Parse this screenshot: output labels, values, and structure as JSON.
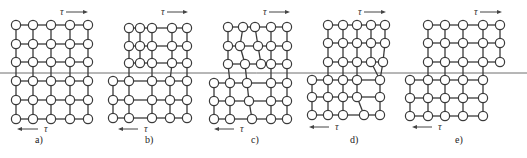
{
  "figure": {
    "caption_visible_fragment": "",
    "shear_symbol": "τ",
    "slip_plane_y": 73,
    "colors": {
      "line": "#3a3a3a",
      "atom_fill": "#ffffff",
      "slip_plane": "#6e6e6e",
      "background": "#ffffff"
    }
  },
  "panels": [
    {
      "label": "a)",
      "label_pos": [
        35,
        143
      ],
      "tau_top": {
        "text": "τ",
        "x": 60,
        "y": 15,
        "arrow": [
          66,
          12,
          88,
          12
        ],
        "dir": "right"
      },
      "tau_bottom": {
        "text": "τ",
        "x": 44,
        "y": 132,
        "arrow": [
          38,
          129,
          17,
          129
        ],
        "dir": "left"
      },
      "rows": [
        {
          "y": 25,
          "x": [
            16,
            33,
            51,
            70,
            88
          ]
        },
        {
          "y": 44,
          "x": [
            16,
            33,
            51,
            70,
            88
          ]
        },
        {
          "y": 62,
          "x": [
            16,
            33,
            51,
            70,
            88
          ]
        },
        {
          "y": 81,
          "x": [
            16,
            33,
            51,
            70,
            88
          ]
        },
        {
          "y": 100,
          "x": [
            16,
            33,
            51,
            70,
            88
          ]
        },
        {
          "y": 119,
          "x": [
            16,
            33,
            51,
            70,
            88
          ]
        }
      ]
    },
    {
      "label": "b)",
      "label_pos": [
        145,
        143
      ],
      "tau_top": {
        "text": "τ",
        "x": 161,
        "y": 15,
        "arrow": [
          167,
          12,
          188,
          12
        ],
        "dir": "right"
      },
      "tau_bottom": {
        "text": "τ",
        "x": 144,
        "y": 132,
        "arrow": [
          138,
          129,
          118,
          129
        ],
        "dir": "left"
      },
      "rows": [
        {
          "y": 28,
          "x": [
            129,
            140,
            152,
            172,
            187
          ]
        },
        {
          "y": 46,
          "x": [
            129,
            140,
            152,
            172,
            187
          ]
        },
        {
          "y": 63,
          "x": [
            129,
            140,
            152,
            172,
            187
          ]
        },
        {
          "y": 81,
          "x": [
            113,
            129,
            152,
            170,
            187
          ]
        },
        {
          "y": 100,
          "x": [
            113,
            129,
            152,
            170,
            187
          ]
        },
        {
          "y": 118,
          "x": [
            113,
            129,
            152,
            170,
            187
          ]
        }
      ]
    },
    {
      "label": "c)",
      "label_pos": [
        251,
        143
      ],
      "tau_top": {
        "text": "τ",
        "x": 263,
        "y": 15,
        "arrow": [
          269,
          12,
          290,
          12
        ],
        "dir": "right"
      },
      "tau_bottom": {
        "text": "τ",
        "x": 240,
        "y": 132,
        "arrow": [
          234,
          129,
          214,
          129
        ],
        "dir": "left"
      },
      "rows": [
        {
          "y": 27,
          "x": [
            228,
            243,
            255,
            271,
            287
          ]
        },
        {
          "y": 46,
          "x": [
            228,
            240,
            258,
            271,
            287
          ]
        },
        {
          "y": 64,
          "x": [
            228,
            245,
            261,
            271,
            287
          ]
        },
        {
          "y": 83,
          "x": [
            214,
            230,
            247,
            271,
            287
          ]
        },
        {
          "y": 101,
          "x": [
            214,
            230,
            249,
            271,
            287
          ]
        },
        {
          "y": 119,
          "x": [
            214,
            230,
            252,
            271,
            287
          ]
        }
      ]
    },
    {
      "label": "d)",
      "label_pos": [
        350,
        143
      ],
      "tau_top": {
        "text": "τ",
        "x": 358,
        "y": 15,
        "arrow": [
          364,
          12,
          386,
          12
        ],
        "dir": "right"
      },
      "tau_bottom": {
        "text": "τ",
        "x": 335,
        "y": 130,
        "arrow": [
          329,
          127,
          309,
          127
        ],
        "dir": "left"
      },
      "rows": [
        {
          "y": 25,
          "x": [
            328,
            343,
            357,
            371,
            385
          ]
        },
        {
          "y": 43,
          "x": [
            328,
            343,
            357,
            371,
            385
          ]
        },
        {
          "y": 62,
          "x": [
            328,
            343,
            357,
            371,
            383
          ]
        },
        {
          "y": 80,
          "x": [
            312,
            328,
            343,
            357,
            380
          ]
        },
        {
          "y": 97,
          "x": [
            312,
            328,
            343,
            357,
            380
          ]
        },
        {
          "y": 115,
          "x": [
            312,
            328,
            343,
            364,
            380
          ]
        }
      ]
    },
    {
      "label": "e)",
      "label_pos": [
        455,
        143
      ],
      "tau_top": {
        "text": "τ",
        "x": 474,
        "y": 15,
        "arrow": [
          480,
          12,
          502,
          12
        ],
        "dir": "right"
      },
      "tau_bottom": {
        "text": "τ",
        "x": 438,
        "y": 130,
        "arrow": [
          432,
          127,
          412,
          127
        ],
        "dir": "left"
      },
      "rows": [
        {
          "y": 25,
          "x": [
            428,
            445,
            463,
            483,
            500
          ]
        },
        {
          "y": 43,
          "x": [
            428,
            445,
            463,
            483,
            500
          ]
        },
        {
          "y": 62,
          "x": [
            428,
            445,
            463,
            483,
            500
          ]
        },
        {
          "y": 80,
          "x": [
            410,
            428,
            445,
            463,
            483
          ]
        },
        {
          "y": 98,
          "x": [
            410,
            428,
            445,
            463,
            483
          ]
        },
        {
          "y": 116,
          "x": [
            410,
            428,
            445,
            463,
            483
          ]
        }
      ]
    }
  ]
}
